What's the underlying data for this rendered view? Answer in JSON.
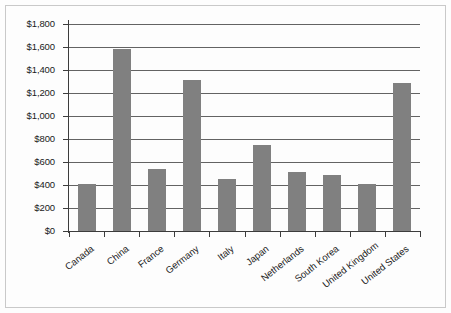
{
  "chart_data": {
    "type": "bar",
    "title": "",
    "subtitle": "",
    "xlabel": "",
    "ylabel": "",
    "categories": [
      "Canada",
      "China",
      "France",
      "Germany",
      "Italy",
      "Japan",
      "Netherlands",
      "South Korea",
      "United Kingdom",
      "United States"
    ],
    "values": [
      410,
      1580,
      540,
      1310,
      450,
      750,
      510,
      485,
      405,
      1290
    ],
    "value_prefix": "$",
    "ylim": [
      0,
      1800
    ],
    "ytick_values": [
      0,
      200,
      400,
      600,
      800,
      1000,
      1200,
      1400,
      1600,
      1800
    ],
    "ytick_labels": [
      "$0",
      "$200",
      "$400",
      "$600",
      "$800",
      "$1,000",
      "$1,200",
      "$1,400",
      "$1,600",
      "$1,800"
    ],
    "grid": true,
    "grid_axis": "y",
    "legend": false,
    "legend_position": "none",
    "series": [
      {
        "name": "Value",
        "color": "#808080",
        "values": [
          410,
          1580,
          540,
          1310,
          450,
          750,
          510,
          485,
          405,
          1290
        ]
      }
    ],
    "bar_color": "#808080",
    "axis_color": "#3c3c3c",
    "grid_color": "#2f2f2f",
    "background_color": "#fdfdfd",
    "xtick_label_rotation": -38,
    "annotations": []
  }
}
